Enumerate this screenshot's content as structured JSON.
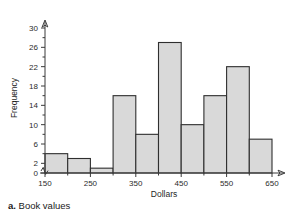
{
  "caption": {
    "label": "a.",
    "text": "Book values"
  },
  "chart_data": {
    "type": "bar",
    "title": "",
    "subtitle": "",
    "xlabel": "Dollars",
    "ylabel": "Frequency",
    "categories": [
      "150-200",
      "200-250",
      "250-300",
      "300-350",
      "350-400",
      "400-450",
      "450-500",
      "500-550",
      "550-600",
      "600-650"
    ],
    "bin_edges": [
      150,
      200,
      250,
      300,
      350,
      400,
      450,
      500,
      550,
      600,
      650
    ],
    "bin_width": 50,
    "values": [
      4,
      3,
      1,
      16,
      8,
      27,
      10,
      16,
      22,
      7
    ],
    "x": [
      175,
      225,
      275,
      325,
      375,
      425,
      475,
      525,
      575,
      625
    ],
    "xlim": [
      150,
      650
    ],
    "ylim": [
      0,
      30
    ],
    "x_ticks": [
      150,
      250,
      350,
      450,
      550,
      650
    ],
    "x_tick_labels": [
      "150",
      "250",
      "350",
      "450",
      "550",
      "650"
    ],
    "y_ticks": [
      0,
      2,
      6,
      10,
      14,
      18,
      22,
      26,
      30
    ],
    "y_tick_labels": [
      "0",
      "2",
      "6",
      "10",
      "14",
      "18",
      "22",
      "26",
      "30"
    ],
    "y_minor_ticks": [
      4,
      8,
      12,
      16,
      20,
      24,
      28
    ],
    "grid": false,
    "legend": null,
    "axis_break_y": true,
    "bar_fill_color": "#d9d9d9",
    "bar_edge_color": "#2f2f2f",
    "axis_color": "#3a3a3a"
  }
}
